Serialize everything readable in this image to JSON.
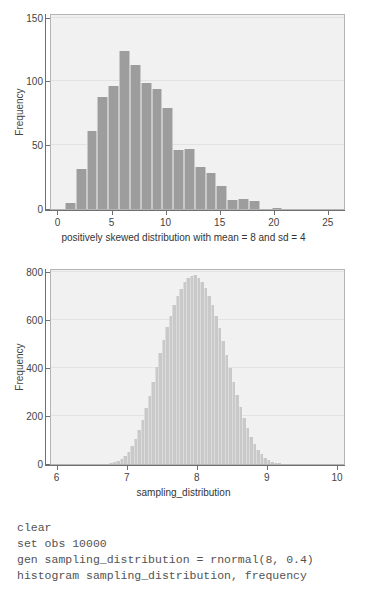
{
  "chart_data": [
    {
      "type": "bar",
      "id": "histogram-skewed",
      "title": "",
      "xlabel": "positively skewed distribution with mean = 8 and sd = 4",
      "ylabel": "Frequency",
      "xlim": [
        -0.6,
        26.5
      ],
      "ylim": [
        0,
        152
      ],
      "xticks": [
        0,
        5,
        10,
        15,
        20,
        25
      ],
      "xtick_labels": [
        "0",
        "5",
        "10",
        "15",
        "20",
        "25"
      ],
      "yticks": [
        0,
        50,
        100,
        150
      ],
      "ytick_labels": [
        "0",
        "50",
        "100",
        "150"
      ],
      "grid": true,
      "bar_color": "#9d9d9d",
      "bin_width": 1,
      "bin_starts": [
        0.7,
        1.7,
        2.7,
        3.7,
        4.7,
        5.7,
        6.7,
        7.7,
        8.7,
        9.7,
        10.7,
        11.7,
        12.7,
        13.7,
        14.7,
        15.7,
        16.7,
        17.7,
        19.8
      ],
      "values": [
        5,
        31,
        61,
        88,
        96,
        124,
        113,
        99,
        94,
        79,
        46,
        47,
        33,
        28,
        18,
        7,
        8,
        6,
        1
      ],
      "categories": [
        "0.7",
        "1.7",
        "2.7",
        "3.7",
        "4.7",
        "5.7",
        "6.7",
        "7.7",
        "8.7",
        "9.7",
        "10.7",
        "11.7",
        "12.7",
        "13.7",
        "14.7",
        "15.7",
        "16.7",
        "17.7",
        "19.8"
      ]
    },
    {
      "type": "bar",
      "id": "histogram-sampling-distribution",
      "title": "",
      "xlabel": "sampling_distribution",
      "ylabel": "Frequency",
      "xlim": [
        5.92,
        10.1
      ],
      "ylim": [
        0,
        810
      ],
      "xticks": [
        6,
        7,
        8,
        9,
        10
      ],
      "xtick_labels": [
        "6",
        "7",
        "8",
        "9",
        "10"
      ],
      "yticks": [
        0,
        200,
        400,
        600,
        800
      ],
      "ytick_labels": [
        "0",
        "200",
        "400",
        "600",
        "800"
      ],
      "grid": true,
      "bar_color": "#c9c9c9",
      "bin_width": 0.05,
      "bin_starts": [
        6.75,
        6.8,
        6.85,
        6.9,
        6.95,
        7.0,
        7.05,
        7.1,
        7.15,
        7.2,
        7.25,
        7.3,
        7.35,
        7.4,
        7.45,
        7.5,
        7.55,
        7.6,
        7.65,
        7.7,
        7.75,
        7.8,
        7.85,
        7.9,
        7.95,
        8.0,
        8.05,
        8.1,
        8.15,
        8.2,
        8.25,
        8.3,
        8.35,
        8.4,
        8.45,
        8.5,
        8.55,
        8.6,
        8.65,
        8.7,
        8.75,
        8.8,
        8.85,
        8.9,
        8.95,
        9.0,
        9.05,
        9.1,
        9.15
      ],
      "values": [
        4,
        8,
        14,
        22,
        34,
        52,
        74,
        104,
        140,
        183,
        232,
        286,
        344,
        404,
        462,
        518,
        570,
        618,
        662,
        700,
        732,
        758,
        775,
        786,
        788,
        778,
        760,
        735,
        702,
        662,
        616,
        566,
        512,
        456,
        400,
        344,
        290,
        238,
        192,
        150,
        114,
        84,
        60,
        41,
        27,
        17,
        10,
        6,
        3
      ],
      "categories": [
        "6.75",
        "6.80",
        "6.85",
        "6.90",
        "6.95",
        "7.00",
        "7.05",
        "7.10",
        "7.15",
        "7.20",
        "7.25",
        "7.30",
        "7.35",
        "7.40",
        "7.45",
        "7.50",
        "7.55",
        "7.60",
        "7.65",
        "7.70",
        "7.75",
        "7.80",
        "7.85",
        "7.90",
        "7.95",
        "8.00",
        "8.05",
        "8.10",
        "8.15",
        "8.20",
        "8.25",
        "8.30",
        "8.35",
        "8.40",
        "8.45",
        "8.50",
        "8.55",
        "8.60",
        "8.65",
        "8.70",
        "8.75",
        "8.80",
        "8.85",
        "8.90",
        "8.95",
        "9.00",
        "9.05",
        "9.10",
        "9.15"
      ]
    }
  ],
  "code": {
    "lines": [
      "clear",
      "set obs 10000",
      "gen sampling_distribution = rnormal(8, 0.4)",
      "histogram sampling_distribution, frequency"
    ]
  },
  "colors": {
    "plot_background": "#f1f1f1",
    "bar_primary": "#9d9d9d",
    "bar_secondary": "#c9c9c9",
    "axis": "#6f6f6f",
    "text": "#444444",
    "code_text": "#535353",
    "page_background": "#ffffff"
  }
}
